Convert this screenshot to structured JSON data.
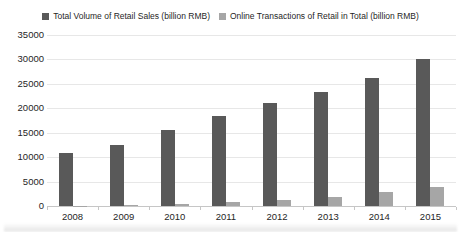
{
  "legend": {
    "items": [
      {
        "label": "Total Volume of Retail Sales  (billion RMB)",
        "color": "#595959"
      },
      {
        "label": "Online Transactions of Retail in Total (billion RMB)",
        "color": "#a6a6a6"
      }
    ]
  },
  "chart_data": {
    "type": "bar",
    "title": "",
    "xlabel": "",
    "ylabel": "",
    "categories": [
      "2008",
      "2009",
      "2010",
      "2011",
      "2012",
      "2013",
      "2014",
      "2015"
    ],
    "series": [
      {
        "name": "Total Volume of Retail Sales (billion RMB)",
        "color": "#595959",
        "values": [
          10800,
          12500,
          15500,
          18400,
          21000,
          23400,
          26200,
          30100
        ]
      },
      {
        "name": "Online Transactions of Retail in Total (billion RMB)",
        "color": "#a6a6a6",
        "values": [
          100,
          300,
          500,
          800,
          1300,
          1900,
          2800,
          3900
        ]
      }
    ],
    "ylim": [
      0,
      35000
    ],
    "ytick_step": 5000,
    "ytick_labels": [
      "0",
      "5000",
      "10000",
      "15000",
      "20000",
      "25000",
      "30000",
      "35000"
    ],
    "grid": true,
    "legend_position": "top"
  },
  "colors": {
    "background": "#ffffff",
    "gridline": "#e7e7e7",
    "axis_line": "#c6c6c6",
    "tick_text": "#262626"
  }
}
